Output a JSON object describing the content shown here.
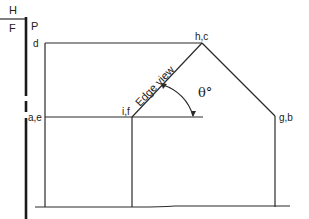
{
  "diagram": {
    "title_labels": {
      "H": "H",
      "F": "F",
      "P": "P"
    },
    "points": {
      "d": "d",
      "hc": "h,c",
      "ae": "a,e",
      "if": "i,f",
      "gb": "g,b"
    },
    "edge_view_label": "Edge view",
    "angle_label": "θ°",
    "colors": {
      "line": "#2a2a2a",
      "background": "#ffffff"
    }
  }
}
